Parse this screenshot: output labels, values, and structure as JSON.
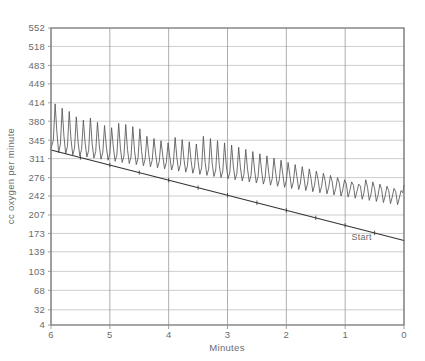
{
  "chart_data": {
    "type": "line",
    "title": "",
    "xlabel": "Minutes",
    "ylabel": "cc oxygen per minute",
    "xlim": [
      6,
      0
    ],
    "ylim": [
      4,
      552
    ],
    "x_reversed": true,
    "grid": true,
    "legend_position": "none",
    "x_ticks": [
      "6",
      "5",
      "4",
      "3",
      "2",
      "1",
      "0"
    ],
    "x_tick_values": [
      6,
      5,
      4,
      3,
      2,
      1,
      0
    ],
    "y_ticks": [
      "552",
      "518",
      "483",
      "449",
      "414",
      "380",
      "345",
      "311",
      "276",
      "242",
      "207",
      "173",
      "139",
      "103",
      "68",
      "32",
      "4"
    ],
    "y_tick_values": [
      552,
      518,
      483,
      449,
      414,
      380,
      345,
      311,
      276,
      242,
      207,
      173,
      139,
      103,
      68,
      32,
      4
    ],
    "annotations": [
      {
        "text": "Start",
        "x": 0.72,
        "y": 160
      }
    ],
    "series": [
      {
        "name": "oxygen-consumption-oscillation",
        "type": "line",
        "color": "#555555",
        "description": "Oscillating breath-by-breath oxygen uptake trace declining over time",
        "points": [
          [
            6.0,
            330
          ],
          [
            5.96,
            345
          ],
          [
            5.93,
            412
          ],
          [
            5.9,
            360
          ],
          [
            5.87,
            322
          ],
          [
            5.84,
            338
          ],
          [
            5.81,
            404
          ],
          [
            5.78,
            352
          ],
          [
            5.75,
            320
          ],
          [
            5.72,
            334
          ],
          [
            5.69,
            398
          ],
          [
            5.66,
            346
          ],
          [
            5.63,
            318
          ],
          [
            5.6,
            330
          ],
          [
            5.57,
            388
          ],
          [
            5.54,
            342
          ],
          [
            5.51,
            316
          ],
          [
            5.48,
            328
          ],
          [
            5.45,
            382
          ],
          [
            5.42,
            340
          ],
          [
            5.39,
            314
          ],
          [
            5.36,
            326
          ],
          [
            5.33,
            386
          ],
          [
            5.3,
            338
          ],
          [
            5.27,
            312
          ],
          [
            5.24,
            324
          ],
          [
            5.21,
            378
          ],
          [
            5.18,
            336
          ],
          [
            5.15,
            310
          ],
          [
            5.12,
            322
          ],
          [
            5.09,
            372
          ],
          [
            5.06,
            334
          ],
          [
            5.03,
            308
          ],
          [
            5.0,
            320
          ],
          [
            4.97,
            368
          ],
          [
            4.94,
            332
          ],
          [
            4.91,
            306
          ],
          [
            4.88,
            318
          ],
          [
            4.85,
            376
          ],
          [
            4.82,
            330
          ],
          [
            4.79,
            304
          ],
          [
            4.76,
            316
          ],
          [
            4.73,
            374
          ],
          [
            4.7,
            328
          ],
          [
            4.67,
            302
          ],
          [
            4.64,
            314
          ],
          [
            4.61,
            370
          ],
          [
            4.58,
            326
          ],
          [
            4.55,
            300
          ],
          [
            4.52,
            312
          ],
          [
            4.49,
            366
          ],
          [
            4.46,
            324
          ],
          [
            4.43,
            298
          ],
          [
            4.4,
            310
          ],
          [
            4.37,
            352
          ],
          [
            4.34,
            320
          ],
          [
            4.31,
            296
          ],
          [
            4.28,
            308
          ],
          [
            4.25,
            348
          ],
          [
            4.22,
            318
          ],
          [
            4.19,
            294
          ],
          [
            4.16,
            306
          ],
          [
            4.13,
            344
          ],
          [
            4.1,
            316
          ],
          [
            4.07,
            292
          ],
          [
            4.04,
            304
          ],
          [
            4.01,
            340
          ],
          [
            3.98,
            314
          ],
          [
            3.95,
            290
          ],
          [
            3.92,
            302
          ],
          [
            3.89,
            350
          ],
          [
            3.86,
            312
          ],
          [
            3.83,
            288
          ],
          [
            3.8,
            300
          ],
          [
            3.77,
            346
          ],
          [
            3.74,
            310
          ],
          [
            3.71,
            286
          ],
          [
            3.68,
            298
          ],
          [
            3.65,
            342
          ],
          [
            3.62,
            308
          ],
          [
            3.59,
            284
          ],
          [
            3.56,
            296
          ],
          [
            3.53,
            338
          ],
          [
            3.5,
            306
          ],
          [
            3.47,
            282
          ],
          [
            3.44,
            294
          ],
          [
            3.41,
            352
          ],
          [
            3.38,
            304
          ],
          [
            3.35,
            280
          ],
          [
            3.32,
            292
          ],
          [
            3.29,
            348
          ],
          [
            3.26,
            302
          ],
          [
            3.23,
            278
          ],
          [
            3.2,
            290
          ],
          [
            3.17,
            344
          ],
          [
            3.14,
            300
          ],
          [
            3.11,
            276
          ],
          [
            3.08,
            288
          ],
          [
            3.05,
            340
          ],
          [
            3.02,
            298
          ],
          [
            2.99,
            274
          ],
          [
            2.96,
            286
          ],
          [
            2.93,
            336
          ],
          [
            2.9,
            296
          ],
          [
            2.87,
            272
          ],
          [
            2.84,
            284
          ],
          [
            2.81,
            332
          ],
          [
            2.78,
            294
          ],
          [
            2.75,
            270
          ],
          [
            2.72,
            282
          ],
          [
            2.69,
            328
          ],
          [
            2.66,
            292
          ],
          [
            2.63,
            268
          ],
          [
            2.6,
            280
          ],
          [
            2.57,
            324
          ],
          [
            2.54,
            290
          ],
          [
            2.51,
            266
          ],
          [
            2.48,
            278
          ],
          [
            2.45,
            320
          ],
          [
            2.42,
            288
          ],
          [
            2.39,
            264
          ],
          [
            2.36,
            276
          ],
          [
            2.33,
            316
          ],
          [
            2.3,
            286
          ],
          [
            2.27,
            262
          ],
          [
            2.24,
            274
          ],
          [
            2.21,
            312
          ],
          [
            2.18,
            284
          ],
          [
            2.15,
            260
          ],
          [
            2.12,
            272
          ],
          [
            2.09,
            308
          ],
          [
            2.06,
            282
          ],
          [
            2.03,
            258
          ],
          [
            2.0,
            270
          ],
          [
            1.97,
            304
          ],
          [
            1.94,
            280
          ],
          [
            1.91,
            256
          ],
          [
            1.88,
            268
          ],
          [
            1.85,
            300
          ],
          [
            1.82,
            278
          ],
          [
            1.79,
            254
          ],
          [
            1.76,
            266
          ],
          [
            1.73,
            296
          ],
          [
            1.7,
            276
          ],
          [
            1.67,
            252
          ],
          [
            1.64,
            264
          ],
          [
            1.61,
            292
          ],
          [
            1.58,
            274
          ],
          [
            1.55,
            250
          ],
          [
            1.52,
            262
          ],
          [
            1.49,
            288
          ],
          [
            1.46,
            272
          ],
          [
            1.43,
            248
          ],
          [
            1.4,
            260
          ],
          [
            1.37,
            284
          ],
          [
            1.34,
            270
          ],
          [
            1.31,
            246
          ],
          [
            1.28,
            258
          ],
          [
            1.25,
            280
          ],
          [
            1.22,
            268
          ],
          [
            1.19,
            244
          ],
          [
            1.16,
            256
          ],
          [
            1.13,
            276
          ],
          [
            1.1,
            266
          ],
          [
            1.07,
            242
          ],
          [
            1.04,
            254
          ],
          [
            1.01,
            272
          ],
          [
            0.98,
            264
          ],
          [
            0.95,
            240
          ],
          [
            0.92,
            252
          ],
          [
            0.89,
            268
          ],
          [
            0.86,
            262
          ],
          [
            0.83,
            238
          ],
          [
            0.8,
            250
          ],
          [
            0.77,
            264
          ],
          [
            0.74,
            260
          ],
          [
            0.71,
            236
          ],
          [
            0.68,
            248
          ],
          [
            0.65,
            272
          ],
          [
            0.62,
            258
          ],
          [
            0.59,
            234
          ],
          [
            0.56,
            246
          ],
          [
            0.53,
            268
          ],
          [
            0.5,
            256
          ],
          [
            0.47,
            232
          ],
          [
            0.44,
            244
          ],
          [
            0.41,
            264
          ],
          [
            0.38,
            254
          ],
          [
            0.35,
            230
          ],
          [
            0.32,
            242
          ],
          [
            0.29,
            260
          ],
          [
            0.26,
            252
          ],
          [
            0.23,
            228
          ],
          [
            0.2,
            240
          ],
          [
            0.17,
            256
          ],
          [
            0.14,
            250
          ],
          [
            0.11,
            226
          ],
          [
            0.08,
            238
          ],
          [
            0.05,
            252
          ],
          [
            0.02,
            248
          ],
          [
            0.0,
            262
          ]
        ]
      },
      {
        "name": "baseline-envelope",
        "type": "line",
        "color": "#333333",
        "description": "Straight descending baseline from start of recovery",
        "points": [
          [
            6.0,
            327
          ],
          [
            0.0,
            160
          ]
        ]
      }
    ]
  }
}
